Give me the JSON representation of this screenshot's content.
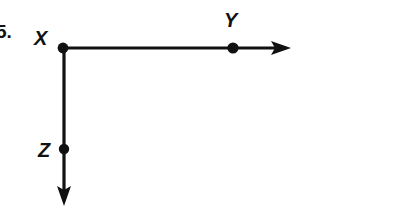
{
  "figure": {
    "background_color": "#ffffff",
    "ink_color": "#111111",
    "problem_number": "5.",
    "width": 399,
    "height": 216
  },
  "points": [
    {
      "name": "point-x",
      "label": "X",
      "x": 63,
      "y": 48,
      "label_x": 40,
      "label_y": 44,
      "dot_radius": 5.4,
      "role": "common-endpoint-vertex"
    },
    {
      "name": "point-y",
      "label": "Y",
      "x": 233,
      "y": 48,
      "label_x": 228,
      "label_y": 26,
      "dot_radius": 5.6,
      "role": "point-on-horizontal-ray"
    },
    {
      "name": "point-z",
      "label": "Z",
      "x": 64,
      "y": 149,
      "label_x": 46,
      "label_y": 156,
      "dot_radius": 5.2,
      "role": "point-on-vertical-ray"
    }
  ],
  "rays": [
    {
      "name": "horizontal-ray-xy",
      "from": "X",
      "through": "Y",
      "direction": "right",
      "start_x": 63,
      "start_y": 48,
      "end_x": 278,
      "end_y": 48,
      "arrow_tip_x": 291,
      "arrow_tip_y": 48
    },
    {
      "name": "vertical-ray-xz",
      "from": "X",
      "through": "Z",
      "direction": "down",
      "start_x": 64,
      "start_y": 48,
      "end_x": 64,
      "end_y": 192,
      "arrow_tip_x": 64,
      "arrow_tip_y": 206
    }
  ],
  "labels": {
    "x_label": "X",
    "y_label": "Y",
    "z_label": "Z",
    "problem_number": "5."
  }
}
